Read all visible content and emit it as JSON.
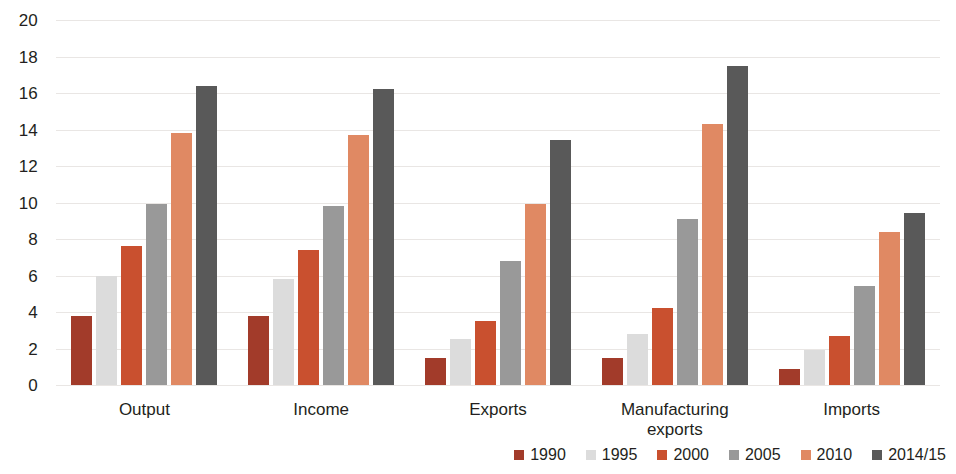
{
  "chart_data": {
    "type": "bar",
    "title": "",
    "subtitle": "",
    "xlabel": "",
    "ylabel": "",
    "ylim": [
      0,
      20
    ],
    "ytick_step": 2,
    "yticks": [
      "20",
      "18",
      "16",
      "14",
      "12",
      "10",
      "8",
      "6",
      "4",
      "2",
      "0"
    ],
    "grid": true,
    "legend_position": "bottom-right",
    "categories": [
      "Output",
      "Income",
      "Exports",
      "Manufacturing\nexports",
      "Imports"
    ],
    "series": [
      {
        "name": "1990",
        "color": "#a23b2a",
        "values": [
          3.8,
          3.8,
          1.5,
          1.5,
          0.9
        ]
      },
      {
        "name": "1995",
        "color": "#dcdcdc",
        "values": [
          6.0,
          5.8,
          2.5,
          2.8,
          1.9
        ]
      },
      {
        "name": "2000",
        "color": "#c9502f",
        "values": [
          7.6,
          7.4,
          3.5,
          4.2,
          2.7
        ]
      },
      {
        "name": "2005",
        "color": "#999999",
        "values": [
          9.9,
          9.8,
          6.8,
          9.1,
          5.4
        ]
      },
      {
        "name": "2010",
        "color": "#e08963",
        "values": [
          13.8,
          13.7,
          9.9,
          14.3,
          8.4
        ]
      },
      {
        "name": "2014/15",
        "color": "#595959",
        "values": [
          16.4,
          16.2,
          13.4,
          17.5,
          9.4
        ]
      }
    ]
  },
  "colors": {
    "gridline": "#e9e6e4",
    "text": "#231f20",
    "background": "#ffffff"
  }
}
